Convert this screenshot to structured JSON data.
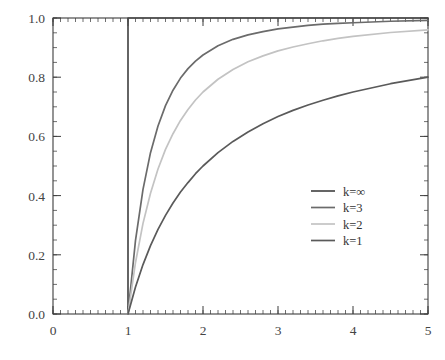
{
  "chart_data": {
    "type": "line",
    "title": "",
    "subtitle": "",
    "xlabel": "",
    "ylabel": "",
    "xlim": [
      0,
      5
    ],
    "ylim": [
      0,
      1.0
    ],
    "grid": false,
    "legend_position": "center-right",
    "x_ticks": [
      "0",
      "1",
      "2",
      "3",
      "4",
      "5"
    ],
    "x_tick_values": [
      0,
      1,
      2,
      3,
      4,
      5
    ],
    "x_minor_tick_step": 0.1,
    "y_ticks": [
      "0.0",
      "0.2",
      "0.4",
      "0.6",
      "0.8",
      "1.0"
    ],
    "y_tick_values": [
      0,
      0.2,
      0.4,
      0.6,
      0.8,
      1.0
    ],
    "y_minor_tick_step": 0.05,
    "series": [
      {
        "name": "k=∞",
        "color": "#4a4a4a",
        "x": [
          1,
          1,
          5
        ],
        "values": [
          0,
          1,
          1
        ],
        "note": "step: vertical rise at x=1 then constant at 1.0"
      },
      {
        "name": "k=3",
        "color": "#6b6b6b",
        "x": [
          1,
          1.1,
          1.2,
          1.3,
          1.4,
          1.5,
          1.6,
          1.7,
          1.8,
          1.9,
          2,
          2.2,
          2.4,
          2.6,
          2.8,
          3,
          3.2,
          3.4,
          3.6,
          3.8,
          4,
          4.5,
          5
        ],
        "values": [
          0,
          0.249,
          0.421,
          0.545,
          0.635,
          0.704,
          0.756,
          0.797,
          0.829,
          0.854,
          0.875,
          0.906,
          0.928,
          0.943,
          0.954,
          0.963,
          0.969,
          0.975,
          0.979,
          0.982,
          0.984,
          0.989,
          0.992
        ]
      },
      {
        "name": "k=2",
        "color": "#c3c3c3",
        "x": [
          1,
          1.1,
          1.2,
          1.3,
          1.4,
          1.5,
          1.6,
          1.7,
          1.8,
          1.9,
          2,
          2.2,
          2.4,
          2.6,
          2.8,
          3,
          3.2,
          3.4,
          3.6,
          3.8,
          4,
          4.5,
          5
        ],
        "values": [
          0,
          0.174,
          0.306,
          0.408,
          0.49,
          0.556,
          0.609,
          0.654,
          0.691,
          0.723,
          0.75,
          0.793,
          0.826,
          0.852,
          0.872,
          0.889,
          0.902,
          0.913,
          0.923,
          0.931,
          0.938,
          0.951,
          0.96
        ]
      },
      {
        "name": "k=1",
        "color": "#5a5a5a",
        "x": [
          1,
          1.1,
          1.2,
          1.3,
          1.4,
          1.5,
          1.6,
          1.7,
          1.8,
          1.9,
          2,
          2.2,
          2.4,
          2.6,
          2.8,
          3,
          3.2,
          3.4,
          3.6,
          3.8,
          4,
          4.5,
          5
        ],
        "values": [
          0,
          0.091,
          0.167,
          0.231,
          0.286,
          0.333,
          0.375,
          0.412,
          0.444,
          0.474,
          0.5,
          0.545,
          0.583,
          0.615,
          0.643,
          0.667,
          0.688,
          0.706,
          0.722,
          0.737,
          0.75,
          0.778,
          0.8
        ]
      }
    ],
    "legend": [
      {
        "label": "k=∞",
        "color": "#4a4a4a"
      },
      {
        "label": "k=3",
        "color": "#6b6b6b"
      },
      {
        "label": "k=2",
        "color": "#c3c3c3"
      },
      {
        "label": "k=1",
        "color": "#5a5a5a"
      }
    ]
  },
  "colors": {
    "background": "#ffffff",
    "axis": "#3d3d3d",
    "text": "#444444"
  }
}
